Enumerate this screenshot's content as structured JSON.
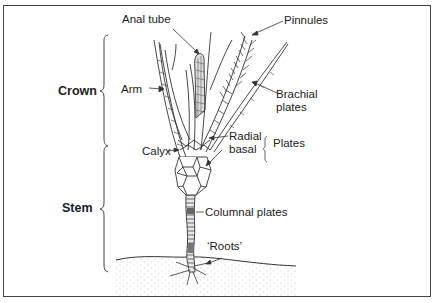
{
  "diagram": {
    "regions": [
      {
        "label": "Crown"
      },
      {
        "label": "Stem"
      }
    ],
    "labels": {
      "anal_tube": "Anal tube",
      "pinnules": "Pinnules",
      "arm": "Arm",
      "brachial_plates_1": "Brachial",
      "brachial_plates_2": "plates",
      "radial": "Radial",
      "basal": "basal",
      "plates": "Plates",
      "calyx": "Calyx",
      "columnal_plates": "Columnal plates",
      "roots": "‘Roots’"
    },
    "colors": {
      "line": "#333333",
      "border": "#444444",
      "ground_dots": "#b5b5b5"
    }
  }
}
